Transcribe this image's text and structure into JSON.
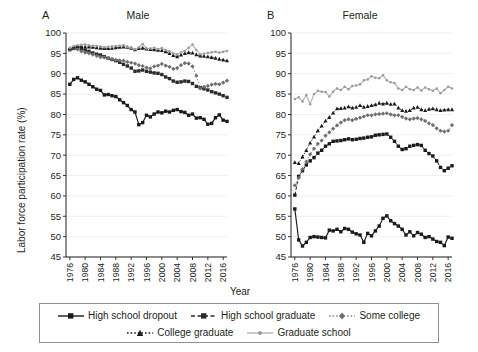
{
  "figure": {
    "ylabel": "Labor force participation rate (%)",
    "xlabel": "Year",
    "panels": [
      {
        "letter": "A",
        "title": "Male"
      },
      {
        "letter": "B",
        "title": "Female"
      }
    ],
    "yticks": [
      "45",
      "50",
      "55",
      "60",
      "65",
      "70",
      "75",
      "80",
      "85",
      "90",
      "95",
      "100"
    ],
    "xticks": [
      "1976",
      "1980",
      "1984",
      "1988",
      "1992",
      "1996",
      "2000",
      "2004",
      "2008",
      "2012",
      "2016"
    ]
  },
  "legend": {
    "rows": [
      [
        {
          "label": "High school dropout",
          "style": "solid",
          "marker": "square",
          "color": "#1a1a1a"
        },
        {
          "label": "High school graduate",
          "style": "dashed",
          "marker": "square",
          "color": "#2b2b2b"
        },
        {
          "label": "Some college",
          "style": "dotted",
          "marker": "diamond",
          "color": "#8a8a8a"
        }
      ],
      [
        {
          "label": "College graduate",
          "style": "dotted",
          "marker": "triangle",
          "color": "#1a1a1a"
        },
        {
          "label": "Graduate school",
          "style": "solid",
          "marker": "dot",
          "color": "#b3b3b3"
        }
      ]
    ]
  },
  "chart_data": [
    {
      "type": "line",
      "title": "Male",
      "panel": "A",
      "xlabel": "Year",
      "ylabel": "Labor force participation rate (%)",
      "xlim": [
        1975,
        2017
      ],
      "ylim": [
        45,
        100
      ],
      "ytick_step": 5,
      "grid": true,
      "legend_position": "bottom",
      "x": [
        1976,
        1977,
        1978,
        1979,
        1980,
        1981,
        1982,
        1983,
        1984,
        1985,
        1986,
        1987,
        1988,
        1989,
        1990,
        1991,
        1992,
        1993,
        1994,
        1995,
        1996,
        1997,
        1998,
        1999,
        2000,
        2001,
        2002,
        2003,
        2004,
        2005,
        2006,
        2007,
        2008,
        2009,
        2010,
        2011,
        2012,
        2013,
        2014,
        2015,
        2016,
        2017
      ],
      "series": [
        {
          "name": "High school dropout",
          "color": "#1a1a1a",
          "style": "solid",
          "marker": "square",
          "values": [
            87.4,
            88.6,
            89.0,
            88.4,
            88.0,
            87.4,
            86.8,
            86.2,
            85.9,
            84.8,
            84.9,
            84.6,
            84.4,
            83.6,
            82.9,
            82.2,
            81.2,
            80.6,
            77.5,
            78.0,
            79.8,
            79.4,
            80.1,
            80.6,
            80.4,
            80.8,
            80.6,
            81.0,
            81.2,
            80.7,
            80.5,
            79.8,
            80.1,
            79.1,
            79.2,
            78.8,
            77.6,
            77.8,
            79.2,
            79.9,
            78.6,
            78.3
          ]
        },
        {
          "name": "High school graduate",
          "color": "#2b2b2b",
          "style": "dashed",
          "marker": "square",
          "values": [
            95.9,
            96.2,
            96.3,
            96.1,
            95.8,
            95.5,
            95.1,
            94.8,
            94.6,
            94.2,
            93.8,
            93.5,
            93.2,
            92.8,
            92.3,
            91.9,
            91.4,
            90.6,
            90.7,
            90.9,
            90.6,
            90.4,
            90.2,
            90.1,
            89.8,
            89.2,
            88.8,
            88.2,
            87.9,
            88.0,
            88.2,
            88.1,
            87.6,
            86.9,
            86.6,
            86.3,
            86.0,
            85.6,
            85.3,
            85.0,
            84.6,
            84.2
          ]
        },
        {
          "name": "Some college",
          "color": "#8a8a8a",
          "style": "dotted",
          "marker": "diamond",
          "values": [
            96.0,
            96.3,
            96.0,
            95.5,
            95.2,
            95.0,
            94.7,
            94.4,
            94.1,
            94.0,
            93.8,
            93.6,
            93.4,
            93.3,
            93.2,
            92.9,
            92.7,
            92.5,
            92.1,
            91.9,
            91.5,
            91.3,
            91.8,
            92.0,
            92.4,
            92.0,
            91.7,
            91.2,
            91.4,
            92.1,
            92.6,
            92.5,
            91.8,
            89.5,
            86.4,
            86.8,
            87.0,
            87.3,
            87.5,
            87.4,
            87.8,
            88.3
          ]
        },
        {
          "name": "College graduate",
          "color": "#1a1a1a",
          "style": "dotted",
          "marker": "triangle",
          "values": [
            96.2,
            96.6,
            96.8,
            96.7,
            96.6,
            96.6,
            96.5,
            96.4,
            96.3,
            96.2,
            96.2,
            96.3,
            96.4,
            96.5,
            96.6,
            96.5,
            96.3,
            95.9,
            96.2,
            96.3,
            96.1,
            96.0,
            95.9,
            95.8,
            95.7,
            95.4,
            95.0,
            94.5,
            94.2,
            94.6,
            95.0,
            95.2,
            95.1,
            94.7,
            94.4,
            94.3,
            94.2,
            94.0,
            93.8,
            93.6,
            93.4,
            93.2
          ]
        },
        {
          "name": "Graduate school",
          "color": "#b3b3b3",
          "style": "solid",
          "marker": "dot",
          "values": [
            96.3,
            96.8,
            97.0,
            97.1,
            97.2,
            97.0,
            96.9,
            96.8,
            96.7,
            96.5,
            96.6,
            96.7,
            96.8,
            96.9,
            97.0,
            96.6,
            96.4,
            96.0,
            96.5,
            97.3,
            96.2,
            96.2,
            96.4,
            96.1,
            96.3,
            95.8,
            95.5,
            95.0,
            94.8,
            95.2,
            95.6,
            96.4,
            97.2,
            95.8,
            94.8,
            94.9,
            95.1,
            95.3,
            95.4,
            95.2,
            95.4,
            95.6
          ]
        }
      ]
    },
    {
      "type": "line",
      "title": "Female",
      "panel": "B",
      "xlabel": "Year",
      "ylabel": "Labor force participation rate (%)",
      "xlim": [
        1975,
        2017
      ],
      "ylim": [
        45,
        100
      ],
      "ytick_step": 5,
      "grid": true,
      "legend_position": "bottom",
      "x": [
        1976,
        1977,
        1978,
        1979,
        1980,
        1981,
        1982,
        1983,
        1984,
        1985,
        1986,
        1987,
        1988,
        1989,
        1990,
        1991,
        1992,
        1993,
        1994,
        1995,
        1996,
        1997,
        1998,
        1999,
        2000,
        2001,
        2002,
        2003,
        2004,
        2005,
        2006,
        2007,
        2008,
        2009,
        2010,
        2011,
        2012,
        2013,
        2014,
        2015,
        2016,
        2017
      ],
      "series": [
        {
          "name": "High school dropout",
          "color": "#1a1a1a",
          "style": "solid",
          "marker": "square",
          "values": [
            56.8,
            49.2,
            47.7,
            48.6,
            49.8,
            50.0,
            49.9,
            49.8,
            49.7,
            51.6,
            51.4,
            51.8,
            51.2,
            52.0,
            51.8,
            51.1,
            50.7,
            50.4,
            48.6,
            50.8,
            50.2,
            51.4,
            52.6,
            54.5,
            55.1,
            53.9,
            53.2,
            52.6,
            51.8,
            50.4,
            51.2,
            50.2,
            51.0,
            50.6,
            49.8,
            50.0,
            49.4,
            48.8,
            48.6,
            47.8,
            49.9,
            49.6
          ]
        },
        {
          "name": "High school graduate",
          "color": "#1a1a1a",
          "style": "dashed",
          "marker": "square",
          "values": [
            60.2,
            64.8,
            66.2,
            67.6,
            68.6,
            69.4,
            70.5,
            71.2,
            72.2,
            72.8,
            73.4,
            73.5,
            73.6,
            73.8,
            74.0,
            73.8,
            73.9,
            74.1,
            74.2,
            74.4,
            74.5,
            74.9,
            75.0,
            75.1,
            75.2,
            74.4,
            73.4,
            72.2,
            71.4,
            71.6,
            72.2,
            72.4,
            72.6,
            72.4,
            71.2,
            70.4,
            69.8,
            68.6,
            67.0,
            66.2,
            66.8,
            67.4
          ]
        },
        {
          "name": "Some college",
          "color": "#8a8a8a",
          "style": "dotted",
          "marker": "diamond",
          "values": [
            62.6,
            64.4,
            66.6,
            68.4,
            70.2,
            71.6,
            72.8,
            73.6,
            74.8,
            75.6,
            76.5,
            77.3,
            78.0,
            78.6,
            78.8,
            78.6,
            78.9,
            79.2,
            79.5,
            79.8,
            79.8,
            80.0,
            80.1,
            80.2,
            80.3,
            80.0,
            79.8,
            79.8,
            79.4,
            79.0,
            78.8,
            79.0,
            79.1,
            78.8,
            78.4,
            77.8,
            77.4,
            76.6,
            76.0,
            75.8,
            76.0,
            77.4
          ]
        },
        {
          "name": "College graduate",
          "color": "#1a1a1a",
          "style": "dotted",
          "marker": "triangle",
          "values": [
            68.2,
            68.0,
            69.6,
            71.2,
            73.0,
            74.5,
            76.0,
            77.2,
            78.4,
            79.3,
            80.4,
            81.4,
            81.5,
            81.6,
            81.9,
            81.6,
            81.8,
            82.2,
            81.8,
            82.0,
            82.2,
            82.4,
            82.8,
            82.6,
            82.8,
            82.5,
            82.6,
            81.6,
            81.0,
            80.8,
            81.0,
            81.6,
            81.8,
            81.2,
            81.0,
            81.3,
            81.4,
            81.2,
            81.0,
            81.1,
            81.2,
            81.2
          ]
        },
        {
          "name": "Graduate school",
          "color": "#b3b3b3",
          "style": "solid",
          "marker": "dot",
          "values": [
            83.8,
            84.2,
            83.2,
            84.8,
            82.5,
            85.0,
            85.8,
            85.6,
            85.5,
            84.4,
            85.6,
            86.4,
            86.0,
            86.8,
            86.2,
            87.0,
            87.1,
            87.4,
            88.4,
            88.6,
            89.4,
            89.0,
            88.9,
            89.6,
            88.4,
            87.9,
            87.7,
            86.4,
            86.0,
            86.8,
            86.2,
            86.0,
            86.6,
            85.9,
            86.6,
            86.2,
            85.8,
            86.4,
            85.2,
            86.0,
            86.8,
            86.4
          ]
        }
      ]
    }
  ]
}
